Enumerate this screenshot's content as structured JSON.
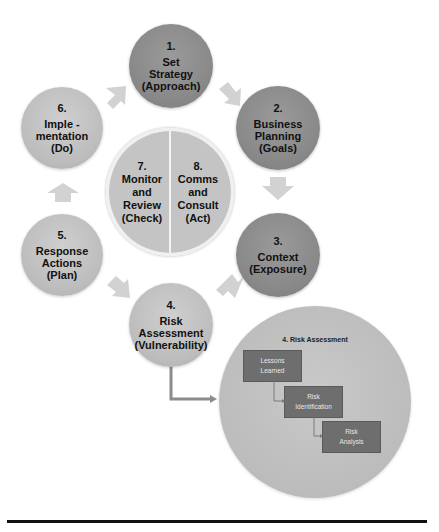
{
  "diagram": {
    "cycle_steps": [
      {
        "number": "1.",
        "lines": [
          "Set",
          "Strategy",
          "(Approach)"
        ],
        "shade": "dark"
      },
      {
        "number": "2.",
        "lines": [
          "Business",
          "Planning",
          "(Goals)"
        ],
        "shade": "dark"
      },
      {
        "number": "3.",
        "lines": [
          "Context",
          "(Exposure)"
        ],
        "shade": "dark"
      },
      {
        "number": "4.",
        "lines": [
          "Risk",
          "Assessment",
          "(Vulnerability)"
        ],
        "shade": "light"
      },
      {
        "number": "5.",
        "lines": [
          "Response",
          "Actions",
          "(Plan)"
        ],
        "shade": "light"
      },
      {
        "number": "6.",
        "lines": [
          "Imple -",
          "mentation",
          "(Do)"
        ],
        "shade": "light"
      }
    ],
    "center": {
      "left": {
        "number": "7.",
        "lines": [
          "Monitor",
          "and",
          "Review",
          "(Check)"
        ]
      },
      "right": {
        "number": "8.",
        "lines": [
          "Comms",
          "and",
          "Consult",
          "(Act)"
        ]
      }
    },
    "detail": {
      "title": "4. Risk Assessment",
      "steps": [
        {
          "lines": [
            "Lessons",
            "Learned"
          ]
        },
        {
          "lines": [
            "Risk",
            "Identification"
          ]
        },
        {
          "lines": [
            "Risk",
            "Analysis"
          ]
        }
      ]
    },
    "colors": {
      "dark_circle": "#8a8a8a",
      "light_circle": "#bdbdbd",
      "arrow": "#d2d2d2",
      "detail_box": "#6e6e6e",
      "connector": "#8c8c8c",
      "rule": "#111111"
    }
  }
}
